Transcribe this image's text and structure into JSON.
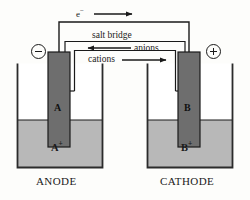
{
  "diagram": {
    "colors": {
      "line": "#1a1a1a",
      "electrode_fill": "#6e6e6e",
      "solution_fill": "#b8b8b8",
      "beaker_fill": "#ffffff",
      "background": "#fdfdfb"
    }
  },
  "labels": {
    "electron": "e",
    "electron_charge": "−",
    "salt_bridge": "salt bridge",
    "anions": "anions",
    "cations": "cations",
    "electrode_a": "A",
    "electrode_b": "B",
    "ion_a": "A",
    "ion_a_charge": "+",
    "ion_b": "B",
    "ion_b_charge": "+",
    "anode": "ANODE",
    "cathode": "CATHODE",
    "terminal_negative": "−",
    "terminal_positive": "+"
  },
  "halfcells": [
    {
      "name": "anode-half-cell",
      "electrode": "A",
      "solution_ion": "A+",
      "role": "ANODE",
      "terminal": "negative"
    },
    {
      "name": "cathode-half-cell",
      "electrode": "B",
      "solution_ion": "B+",
      "role": "CATHODE",
      "terminal": "positive"
    }
  ],
  "flows": [
    {
      "name": "electron-flow",
      "label": "e−",
      "direction": "left-to-right"
    },
    {
      "name": "anion-flow",
      "label": "anions",
      "direction": "right-to-left"
    },
    {
      "name": "cation-flow",
      "label": "cations",
      "direction": "left-to-right"
    }
  ]
}
